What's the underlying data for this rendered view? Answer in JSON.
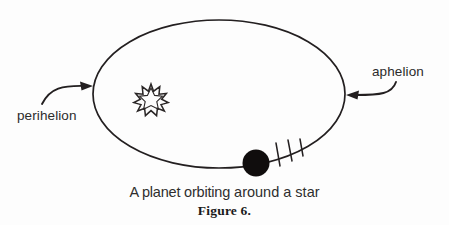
{
  "figure": {
    "caption": "A planet orbiting around a star",
    "caption_part_1": "A planet orbiting",
    "caption_part_2": "around a star",
    "number_label": "Figure 6.",
    "background_color": "#fdfdfd",
    "ink_color": "#231f20"
  },
  "annotations": {
    "perihelion": {
      "label": "perihelion",
      "arrow_direction": "right",
      "points_to": "orbit-left-vertex"
    },
    "aphelion": {
      "label": "aphelion",
      "arrow_direction": "left",
      "points_to": "orbit-right-vertex"
    }
  },
  "objects": {
    "orbit": {
      "name": "elliptical-orbit",
      "center_x": 219,
      "center_y": 94,
      "radius_x": 126,
      "radius_y": 74,
      "stroke_width": 1.6
    },
    "star": {
      "name": "star-glyph",
      "center_x": 151,
      "center_y": 97,
      "points": 11,
      "outer_radius": 13,
      "inner_radius": 6,
      "filled": false
    },
    "planet": {
      "name": "planet-body",
      "center_x": 256,
      "center_y": 163,
      "radius": 13.5,
      "fill": "#100d0d"
    },
    "motion_ticks": {
      "name": "motion-tick-marks",
      "count": 3
    }
  }
}
